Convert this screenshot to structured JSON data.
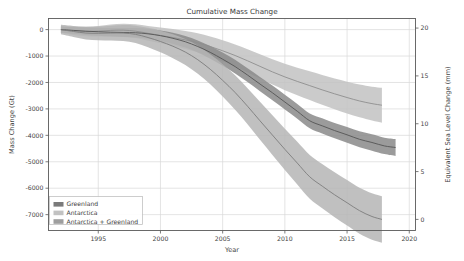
{
  "figure": {
    "background_color": "#ffffff",
    "plot_background_color": "#ffffff",
    "grid_color": "#d8d8d8",
    "axis_color": "#5a5a5a",
    "text_color": "#444444"
  },
  "chart_data": {
    "type": "area",
    "title": "Cumulative Mass Change",
    "xlabel": "Year",
    "ylabel": "Mass Change (Gt)",
    "y2label": "Equivalent Sea Level Change (mm)",
    "xlim": [
      1991,
      2020.5
    ],
    "ylim": [
      -7600,
      420
    ],
    "y2lim": [
      -1.16,
      21.0
    ],
    "xticks": [
      1995,
      2000,
      2005,
      2010,
      2015,
      2020
    ],
    "xticklabels": [
      "1995",
      "2000",
      "2005",
      "2010",
      "2015",
      "2020"
    ],
    "yticks": [
      0,
      -1000,
      -2000,
      -3000,
      -4000,
      -5000,
      -6000,
      -7000
    ],
    "yticklabels": [
      "0",
      "-1000",
      "-2000",
      "-3000",
      "-4000",
      "-5000",
      "-6000",
      "-7000"
    ],
    "y2ticks": [
      0,
      5,
      10,
      15,
      20
    ],
    "y2ticklabels": [
      "0",
      "5",
      "10",
      "15",
      "20"
    ],
    "grid": true,
    "legend_position": "lower left",
    "series": [
      {
        "name": "Antarctica",
        "color": "#b0b0b0",
        "band_color": "#c2c2c2",
        "line_color": "#8e8e8e",
        "x": [
          1992,
          1993,
          1994,
          1995,
          1996,
          1997,
          1998,
          1999,
          2000,
          2001,
          2002,
          2003,
          2004,
          2005,
          2006,
          2007,
          2008,
          2009,
          2010,
          2011,
          2012,
          2013,
          2014,
          2015,
          2016,
          2017,
          2017.8
        ],
        "values": [
          0,
          -40,
          -70,
          -60,
          -30,
          -20,
          -60,
          -140,
          -220,
          -300,
          -390,
          -500,
          -640,
          -800,
          -980,
          -1180,
          -1390,
          -1600,
          -1790,
          -1960,
          -2120,
          -2280,
          -2430,
          -2570,
          -2700,
          -2800,
          -2860
        ],
        "lower": [
          -130,
          -200,
          -250,
          -260,
          -250,
          -260,
          -320,
          -420,
          -520,
          -620,
          -730,
          -860,
          -1020,
          -1200,
          -1400,
          -1620,
          -1850,
          -2080,
          -2290,
          -2480,
          -2660,
          -2840,
          -3010,
          -3170,
          -3320,
          -3440,
          -3520
        ],
        "upper": [
          130,
          120,
          110,
          140,
          190,
          220,
          200,
          140,
          80,
          20,
          -50,
          -140,
          -260,
          -400,
          -560,
          -740,
          -930,
          -1120,
          -1290,
          -1440,
          -1580,
          -1720,
          -1850,
          -1970,
          -2080,
          -2160,
          -2200
        ]
      },
      {
        "name": "Greenland",
        "color": "#7a7a7a",
        "band_color": "#8a8a8a",
        "line_color": "#555555",
        "x": [
          1992,
          1993,
          1994,
          1995,
          1996,
          1997,
          1998,
          1999,
          2000,
          2001,
          2002,
          2003,
          2004,
          2005,
          2006,
          2007,
          2008,
          2009,
          2010,
          2011,
          2012,
          2013,
          2014,
          2015,
          2016,
          2017,
          2018,
          2018.9
        ],
        "values": [
          0,
          -30,
          -60,
          -80,
          -100,
          -110,
          -120,
          -160,
          -230,
          -330,
          -460,
          -640,
          -860,
          -1120,
          -1400,
          -1720,
          -2060,
          -2390,
          -2740,
          -3090,
          -3450,
          -3640,
          -3820,
          -3980,
          -4150,
          -4270,
          -4400,
          -4460
        ],
        "lower": [
          -120,
          -160,
          -200,
          -230,
          -260,
          -280,
          -300,
          -350,
          -430,
          -540,
          -680,
          -870,
          -1100,
          -1370,
          -1660,
          -1980,
          -2330,
          -2670,
          -3020,
          -3370,
          -3730,
          -3930,
          -4110,
          -4280,
          -4450,
          -4580,
          -4710,
          -4780
        ],
        "upper": [
          120,
          100,
          80,
          70,
          60,
          60,
          60,
          30,
          -30,
          -120,
          -240,
          -410,
          -620,
          -870,
          -1140,
          -1460,
          -1790,
          -2110,
          -2460,
          -2810,
          -3170,
          -3350,
          -3530,
          -3680,
          -3850,
          -3960,
          -4090,
          -4140
        ]
      },
      {
        "name": "Antarctica + Greenland",
        "color": "#9e9e9e",
        "band_color": "#b5b5b5",
        "line_color": "#7d7d7d",
        "x": [
          1992,
          1993,
          1994,
          1995,
          1996,
          1997,
          1998,
          1999,
          2000,
          2001,
          2002,
          2003,
          2004,
          2005,
          2006,
          2007,
          2008,
          2009,
          2010,
          2011,
          2012,
          2013,
          2014,
          2015,
          2016,
          2017,
          2017.8
        ],
        "values": [
          0,
          -70,
          -130,
          -140,
          -130,
          -130,
          -180,
          -300,
          -450,
          -630,
          -850,
          -1140,
          -1500,
          -1920,
          -2380,
          -2900,
          -3450,
          -3990,
          -4530,
          -5050,
          -5570,
          -5920,
          -6250,
          -6550,
          -6850,
          -7070,
          -7180
        ],
        "lower": [
          -180,
          -280,
          -370,
          -400,
          -410,
          -430,
          -510,
          -670,
          -860,
          -1080,
          -1340,
          -1670,
          -2070,
          -2530,
          -3030,
          -3580,
          -4170,
          -4740,
          -5310,
          -5860,
          -6400,
          -6760,
          -7100,
          -7410,
          -7720,
          -7950,
          -8060
        ],
        "upper": [
          180,
          140,
          110,
          120,
          150,
          170,
          150,
          70,
          -40,
          -180,
          -360,
          -610,
          -930,
          -1310,
          -1730,
          -2220,
          -2730,
          -3240,
          -3750,
          -4240,
          -4740,
          -5080,
          -5400,
          -5690,
          -5980,
          -6190,
          -6300
        ]
      }
    ],
    "legend": [
      {
        "label": "Greenland",
        "swatch_color": "#7a7a7a"
      },
      {
        "label": "Antarctica",
        "swatch_color": "#c2c2c2"
      },
      {
        "label": "Antarctica + Greenland",
        "swatch_color": "#9e9e9e"
      }
    ]
  }
}
